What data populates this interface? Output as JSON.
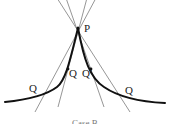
{
  "diagram": {
    "point_label": "P",
    "q_labels": [
      "Q",
      "Q",
      "Q'",
      "Q"
    ],
    "caption": "Case B",
    "colors": {
      "curve": "#111111",
      "lines": "#8a8a8a",
      "text": "#222222"
    }
  }
}
